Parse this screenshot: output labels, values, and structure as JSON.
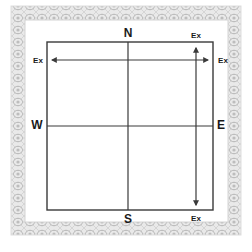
{
  "diagram": {
    "type": "compass-layout-diagram",
    "directions": {
      "north": "N",
      "south": "S",
      "east": "E",
      "west": "W"
    },
    "extension_labels": {
      "horizontal_left": "Ex",
      "horizontal_right": "Ex",
      "vertical_top": "Ex",
      "vertical_bottom": "Ex"
    },
    "arrows": [
      {
        "name": "horizontal-extension-arrow",
        "orientation": "horizontal",
        "heads": "both"
      },
      {
        "name": "vertical-extension-arrow",
        "orientation": "vertical",
        "heads": "both"
      }
    ],
    "colors": {
      "line": "#3a3a3a",
      "border_pattern": "#c9c9c9",
      "border_pattern_dark": "#a8a8a8",
      "background": "#ffffff",
      "text": "#1a1a1a"
    }
  }
}
